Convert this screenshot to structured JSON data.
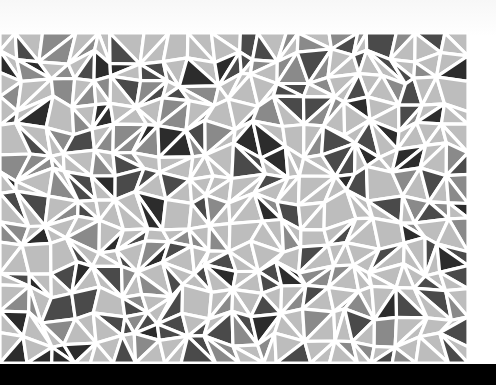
{
  "image": {
    "description": "Grayscale mosaic of white-grouted triangles and quadrilaterals on paper, with a black band along the bottom edge",
    "caption": "Triangle mosaic pattern"
  },
  "mosaic": {
    "x": 0,
    "y": 33,
    "width": 468,
    "height": 330,
    "cols": 20,
    "rows": 14,
    "grout_color": "#ffffff",
    "grout_width": 3.2,
    "tones": {
      "light": "#bdbdbd",
      "mid": "#8a8a8a",
      "dark": "#4a4a4a",
      "darkest": "#2c2c2c"
    },
    "tone_weights": [
      0.58,
      0.17,
      0.18,
      0.07
    ],
    "seed": 17
  },
  "bottom_band": {
    "color": "#000000",
    "height": 21
  }
}
